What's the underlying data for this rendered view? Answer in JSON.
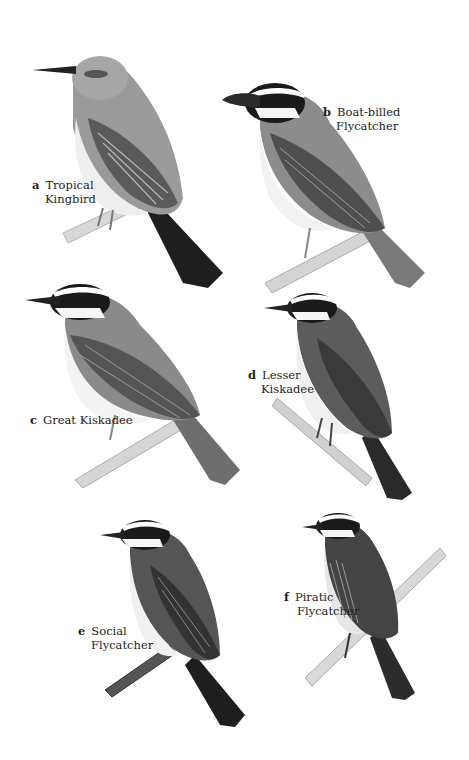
{
  "plate": {
    "background": "#ffffff",
    "birds": [
      {
        "letter": "a",
        "name_line1": "Tropical",
        "name_line2": "Kingbird"
      },
      {
        "letter": "b",
        "name_line1": "Boat-billed",
        "name_line2": "Flycatcher"
      },
      {
        "letter": "c",
        "name_line1": "Great Kiskadee",
        "name_line2": ""
      },
      {
        "letter": "d",
        "name_line1": "Lesser",
        "name_line2": "Kiskadee"
      },
      {
        "letter": "e",
        "name_line1": "Social",
        "name_line2": "Flycatcher"
      },
      {
        "letter": "f",
        "name_line1": "Piratic",
        "name_line2": "Flycatcher"
      }
    ]
  }
}
